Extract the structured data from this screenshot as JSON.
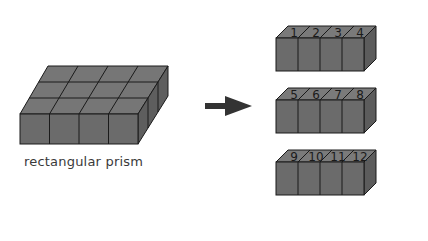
{
  "diagram": {
    "left": {
      "label": "rectangular prism",
      "grid": {
        "columns": 4,
        "rows": 3,
        "layers": 1
      },
      "cube_color": "#6b6b6b"
    },
    "arrow": {
      "direction": "right",
      "color": "#333333"
    },
    "right": {
      "rows": [
        {
          "numbers": [
            "1",
            "2",
            "3",
            "4"
          ]
        },
        {
          "numbers": [
            "5",
            "6",
            "7",
            "8"
          ]
        },
        {
          "numbers": [
            "9",
            "10",
            "11",
            "12"
          ]
        }
      ]
    },
    "colors": {
      "front": "#6b6b6b",
      "top": "#7a7a7a",
      "side": "#5c5c5c",
      "edge": "#1a1a1a"
    }
  }
}
